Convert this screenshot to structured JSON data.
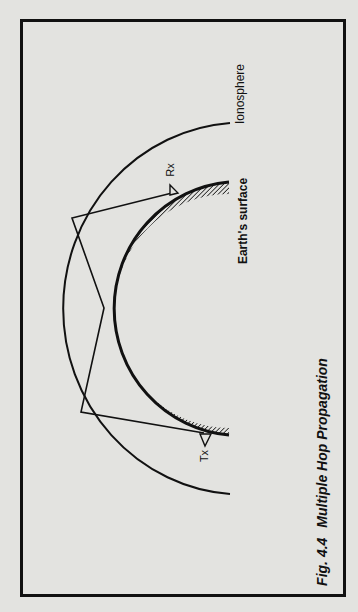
{
  "figure": {
    "caption_number": "Fig. 4.4",
    "caption_title": "Multiple Hop Propagation",
    "labels": {
      "ionosphere": "Ionosphere",
      "earth_surface": "Earth's surface",
      "receiver": "Rx",
      "transmitter": "Tx"
    }
  },
  "diagram": {
    "colors": {
      "background": "#e3e3e0",
      "ink": "#111111"
    },
    "ionosphere_arc": {
      "cx": 230,
      "cy": 308,
      "rx": 180,
      "ry": 186
    },
    "earth_outer_arc": {
      "cx": 230,
      "cy": 308,
      "rx": 126,
      "ry": 127
    },
    "earth_inner_arc": {
      "cx": 232,
      "cy": 312,
      "rx": 110,
      "ry": 114
    },
    "ray_path": [
      {
        "name": "Tx",
        "x": 204,
        "y": 433
      },
      {
        "name": "ionosphere-reflection-1",
        "x": 81,
        "y": 412
      },
      {
        "name": "ground-reflection",
        "x": 104,
        "y": 308
      },
      {
        "name": "ionosphere-reflection-2",
        "x": 72,
        "y": 218
      },
      {
        "name": "Rx",
        "x": 172,
        "y": 193
      }
    ]
  }
}
